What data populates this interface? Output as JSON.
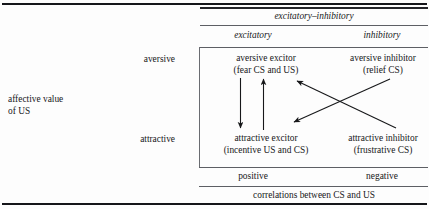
{
  "figure": {
    "side_label": {
      "line1": "affective value",
      "line2": "of US"
    },
    "row_labels": {
      "aversive": "aversive",
      "attractive": "attractive"
    },
    "column_group_heading": "excitatory–inhibitory",
    "column_headings": {
      "excitatory": "excitatory",
      "inhibitory": "inhibitory"
    },
    "footer_labels": {
      "positive": "positive",
      "negative": "negative"
    },
    "footer_caption": "correlations between CS and US",
    "cells": [
      {
        "id": "aversive-excitor",
        "line1": "aversive excitor",
        "line2": "(fear CS and US)"
      },
      {
        "id": "aversive-inhibitor",
        "line1": "aversive inhibitor",
        "line2": "(relief CS)"
      },
      {
        "id": "attractive-excitor",
        "line1": "attractive excitor",
        "line2": "(incentive US and CS)"
      },
      {
        "id": "attractive-inhibitor",
        "line1": "attractive inhibitor",
        "line2": "(frustrative CS)"
      }
    ],
    "arrows": [
      {
        "id": "aversive-excitor-to-attractive-excitor",
        "direction": "down"
      },
      {
        "id": "attractive-excitor-to-aversive-excitor",
        "direction": "up"
      },
      {
        "id": "attractive-inhibitor-to-aversive-excitor",
        "direction": "up-left"
      },
      {
        "id": "aversive-inhibitor-to-attractive-excitor",
        "direction": "down-left"
      }
    ],
    "colors": {
      "ink": "#17181a",
      "rule": "#15161a",
      "thin_rule": "#5d5f64",
      "background": "#fdfdfd"
    }
  }
}
